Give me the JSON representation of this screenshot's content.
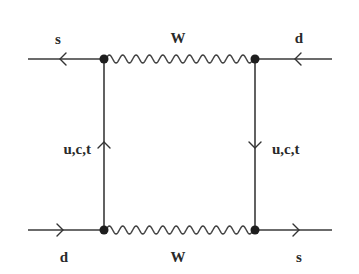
{
  "diagram": {
    "type": "feynman-box-diagram",
    "colors": {
      "line": "#3a3a3a",
      "vertex": "#1e1e1e",
      "text": "#2a2a2a",
      "background": "#ffffff"
    },
    "labels": {
      "top_left": "s",
      "top_right": "d",
      "top_boson": "W",
      "bottom_left": "d",
      "bottom_right": "s",
      "bottom_boson": "W",
      "left_internal": "u,c,t",
      "right_internal": "u,c,t"
    },
    "vertices": [
      {
        "name": "top-left",
        "x": 104,
        "y": 59
      },
      {
        "name": "top-right",
        "x": 255,
        "y": 59
      },
      {
        "name": "bottom-left",
        "x": 104,
        "y": 230
      },
      {
        "name": "bottom-right",
        "x": 255,
        "y": 230
      }
    ],
    "edges": [
      {
        "from": "external-left-top",
        "to": "top-left",
        "particle": "s",
        "arrow": "left"
      },
      {
        "from": "external-right-top",
        "to": "top-right",
        "particle": "d",
        "arrow": "left"
      },
      {
        "from": "top-left",
        "to": "top-right",
        "particle": "W",
        "style": "wavy"
      },
      {
        "from": "bottom-left",
        "to": "top-left",
        "particle": "u,c,t",
        "arrow": "up"
      },
      {
        "from": "top-right",
        "to": "bottom-right",
        "particle": "u,c,t",
        "arrow": "down"
      },
      {
        "from": "bottom-left",
        "to": "bottom-right",
        "particle": "W",
        "style": "wavy"
      },
      {
        "from": "external-left-bottom",
        "to": "bottom-left",
        "particle": "d",
        "arrow": "right"
      },
      {
        "from": "bottom-right",
        "to": "external-right-bottom",
        "particle": "s",
        "arrow": "right"
      }
    ]
  }
}
